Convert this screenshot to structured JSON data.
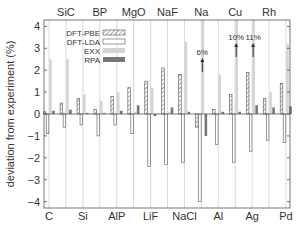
{
  "chart_data": {
    "type": "bar",
    "title": "",
    "xlabel": "",
    "ylabel": "deviation from experiment (%)",
    "ylim": [
      -4.2,
      4.3
    ],
    "yticks": [
      -4,
      -3,
      -2,
      -1,
      0,
      1,
      2,
      3,
      4
    ],
    "grid": "vertical lines at each material",
    "legend_position": "upper left inside",
    "categories": [
      "C",
      "SiC",
      "Si",
      "BP",
      "AlP",
      "MgO",
      "LiF",
      "NaF",
      "NaCl",
      "Na",
      "Al",
      "Cu",
      "Ag",
      "Rh",
      "Pd"
    ],
    "top_labels": [
      "SiC",
      "BP",
      "MgO",
      "NaF",
      "Na",
      "Cu",
      "Rh"
    ],
    "bottom_labels": [
      "C",
      "Si",
      "AlP",
      "LiF",
      "NaCl",
      "Al",
      "Ag",
      "Pd"
    ],
    "series": [
      {
        "name": "DFT-PBE",
        "style": "hatched",
        "values": [
          0.1,
          0.5,
          0.7,
          0.2,
          0.8,
          1.2,
          1.5,
          2.1,
          1.8,
          -0.6,
          0.2,
          0.9,
          1.9,
          0.7,
          1.4
        ]
      },
      {
        "name": "DFT-LDA",
        "style": "open",
        "values": [
          -0.9,
          -0.6,
          -0.5,
          -1.0,
          -0.5,
          -0.9,
          -2.4,
          -2.3,
          -2.2,
          -4.0,
          -1.4,
          -2.2,
          -1.7,
          -1.2,
          -1.3
        ]
      },
      {
        "name": "EXX",
        "style": "light-gray",
        "values": [
          2.5,
          2.5,
          0.9,
          0.6,
          1.0,
          0.1,
          1.2,
          0.1,
          3.3,
          6.0,
          1.8,
          10.0,
          11.0,
          1.0,
          3.2
        ]
      },
      {
        "name": "RPA",
        "style": "dark-gray",
        "values": [
          0.15,
          0.2,
          0.05,
          0.05,
          0.15,
          0.4,
          -0.1,
          0.3,
          0.1,
          -1.0,
          0.1,
          0.1,
          0.4,
          0.3,
          0.35
        ]
      }
    ],
    "annotations": [
      {
        "text": "6%",
        "category": "Na",
        "series": "EXX",
        "arrow": "up"
      },
      {
        "text": "10%",
        "category": "Cu",
        "series": "EXX",
        "arrow": "up"
      },
      {
        "text": "11%",
        "category": "Ag",
        "series": "EXX",
        "arrow": "up"
      }
    ]
  },
  "legend": {
    "items": [
      {
        "label": "DFT-PBE",
        "style": "hatched"
      },
      {
        "label": "DFT-LDA",
        "style": "open"
      },
      {
        "label": "EXX",
        "style": "light"
      },
      {
        "label": "RPA",
        "style": "dark"
      }
    ]
  },
  "colors": {
    "axis": "#555555",
    "grid": "#cfcfcf",
    "exx": "#d4d4d4",
    "rpa": "#777777",
    "hatch": "#555555"
  }
}
